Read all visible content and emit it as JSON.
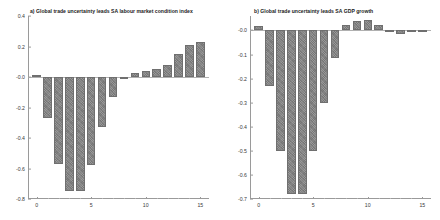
{
  "figure": {
    "width": 440,
    "height": 220,
    "background": "#ffffff",
    "bar_color": "#828282",
    "axis_color": "#9a9a9a"
  },
  "chart_data": [
    {
      "type": "bar",
      "panel_id": "a",
      "title": "a) Global trade uncertainty leads SA labour market condition index",
      "xlabel": "",
      "ylabel": "",
      "grid": false,
      "legend": false,
      "xlim": [
        -0.8,
        15.8
      ],
      "ylim": [
        -0.8,
        0.4
      ],
      "yticks": [
        0.4,
        0.2,
        -0.0,
        -0.2,
        -0.4,
        -0.6,
        -0.8
      ],
      "ytick_labels": [
        "0.4",
        "0.2",
        "-0.0",
        "-0.2",
        "-0.4",
        "-0.6",
        "-0.8"
      ],
      "xticks": [
        0,
        5,
        10,
        15
      ],
      "xtick_labels": [
        "0",
        "5",
        "10",
        "15"
      ],
      "categories": [
        0,
        1,
        2,
        3,
        4,
        5,
        6,
        7,
        8,
        9,
        10,
        11,
        12,
        13,
        14,
        15
      ],
      "values": [
        0.012,
        -0.27,
        -0.57,
        -0.75,
        -0.75,
        -0.58,
        -0.33,
        -0.13,
        -0.012,
        0.028,
        0.037,
        0.053,
        0.078,
        0.148,
        0.208,
        0.228
      ]
    },
    {
      "type": "bar",
      "panel_id": "b",
      "title": "b) Global trade uncertainty leads SA GDP growth",
      "xlabel": "",
      "ylabel": "",
      "grid": false,
      "legend": false,
      "xlim": [
        -0.8,
        15.8
      ],
      "ylim": [
        -0.7,
        0.06
      ],
      "yticks": [
        -0.0,
        -0.1,
        -0.2,
        -0.3,
        -0.4,
        -0.5,
        -0.6,
        -0.7
      ],
      "ytick_labels": [
        "-0.0",
        "-0.1",
        "-0.2",
        "-0.3",
        "-0.4",
        "-0.5",
        "-0.6",
        "-0.7"
      ],
      "xticks": [
        0,
        5,
        10,
        15
      ],
      "xtick_labels": [
        "0",
        "5",
        "10",
        "15"
      ],
      "categories": [
        0,
        1,
        2,
        3,
        4,
        5,
        6,
        7,
        8,
        9,
        10,
        11,
        12,
        13,
        14,
        15
      ],
      "values": [
        0.018,
        -0.23,
        -0.5,
        -0.68,
        -0.68,
        -0.5,
        -0.3,
        -0.115,
        0.022,
        0.04,
        0.045,
        0.022,
        -0.006,
        -0.014,
        -0.008,
        -0.005
      ]
    }
  ]
}
